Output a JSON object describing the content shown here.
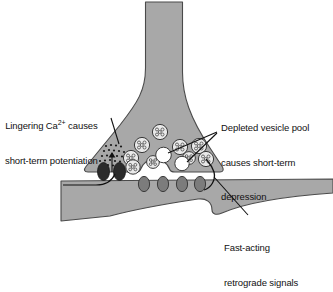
{
  "figure": {
    "type": "biology-diagram",
    "background_color": "#ffffff",
    "cell_fill": "#a8a8a8",
    "cell_stroke": "#4a4a4a",
    "vesicle_fill": "#e9e9e9",
    "vesicle_stroke": "#3a3a3a",
    "empty_vesicle_fill": "#ffffff",
    "channel_fill": "#2b2b2b",
    "receptor_fill": "#7c7c7c",
    "receptor_stroke": "#3a3a3a",
    "ion_color": "#1a1a1a",
    "leader_color": "#111111"
  },
  "labels": {
    "potentiation": {
      "line1_pre": "Lingering Ca",
      "line1_sup": "2+",
      "line1_post": " causes",
      "line2": "short-term potentiation"
    },
    "depression": {
      "line1": "Depleted vesicle pool",
      "line2": "causes short-term",
      "line3": "depression"
    },
    "retrograde": {
      "line1": "Fast-acting",
      "line2": "retrograde signals"
    }
  },
  "structures": {
    "axon_terminal": "presynaptic-bouton",
    "postsynaptic_cell": "postsynaptic-dendrite",
    "calcium_channels_count": 2,
    "receptors_count": 4,
    "filled_vesicles_count": 9,
    "empty_vesicles_count": 2,
    "calcium_ions_count": 22
  }
}
